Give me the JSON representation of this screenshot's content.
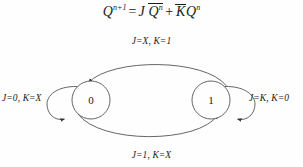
{
  "equation": {
    "lhs_var": "Q",
    "lhs_sup": "n+1",
    "eq": "=",
    "term1_coef": "J",
    "term1_var": "Q",
    "term1_sup": "n",
    "plus": "+",
    "term2_coef": "K",
    "term2_var": "Q",
    "term2_sup": "n",
    "full_text": "Q^(n+1) = J Q̄^n + K̄ Q^n"
  },
  "diagram": {
    "type": "state-transition-diagram",
    "states": [
      {
        "id": "state-0",
        "label": "0",
        "cx": 91,
        "cy": 100,
        "r": 19
      },
      {
        "id": "state-1",
        "label": "1",
        "cx": 211,
        "cy": 100,
        "r": 19
      }
    ],
    "transitions": [
      {
        "id": "transition-1-to-0",
        "from": "1",
        "to": "0",
        "label": "J=X, K=1",
        "position": "top"
      },
      {
        "id": "transition-0-to-1",
        "from": "0",
        "to": "1",
        "label": "J=1, K=X",
        "position": "bottom"
      },
      {
        "id": "self-loop-0",
        "from": "0",
        "to": "0",
        "label": "J=0, K=X",
        "position": "left"
      },
      {
        "id": "self-loop-1",
        "from": "1",
        "to": "1",
        "label": "J=K, K=0",
        "position": "right"
      }
    ]
  },
  "colors": {
    "ink": "#1a1a1a",
    "stroke": "#555555",
    "background": "#fefefe"
  }
}
